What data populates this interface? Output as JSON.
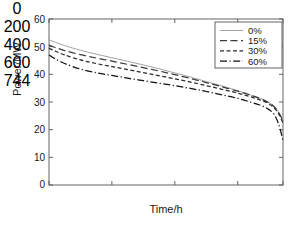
{
  "chart_data": {
    "type": "line",
    "title": "",
    "xlabel": "Time/h",
    "ylabel": "Power/MW",
    "xlim": [
      0,
      744
    ],
    "ylim": [
      0,
      60
    ],
    "xticks": [
      0,
      200,
      400,
      600,
      744
    ],
    "yticks": [
      0,
      10,
      20,
      30,
      40,
      50,
      60
    ],
    "grid": false,
    "legend_position": "upper right",
    "x": [
      0,
      20,
      50,
      100,
      150,
      200,
      250,
      300,
      350,
      400,
      450,
      500,
      550,
      600,
      640,
      670,
      695,
      715,
      730,
      744
    ],
    "series": [
      {
        "name": "0%",
        "label": "0%",
        "color": "#999999",
        "dash": "solid",
        "values": [
          52.5,
          51.6,
          50.4,
          48.7,
          47.3,
          46.0,
          44.7,
          43.4,
          42.0,
          40.5,
          39.0,
          37.4,
          35.8,
          34.1,
          32.6,
          31.4,
          30.1,
          28.5,
          26.3,
          23.3
        ]
      },
      {
        "name": "15%",
        "label": "15%",
        "color": "#3a3a3a",
        "dash": "long-dash",
        "values": [
          50.6,
          49.7,
          48.6,
          47.1,
          45.9,
          44.8,
          43.6,
          42.4,
          41.2,
          39.9,
          38.5,
          37.0,
          35.5,
          33.9,
          32.5,
          31.3,
          30.0,
          28.4,
          26.2,
          23.2
        ]
      },
      {
        "name": "30%",
        "label": "30%",
        "color": "#2a2a2a",
        "dash": "short-dash",
        "values": [
          49.4,
          48.4,
          47.0,
          45.2,
          43.9,
          42.8,
          41.7,
          40.6,
          39.5,
          38.4,
          37.2,
          35.9,
          34.6,
          33.2,
          31.9,
          30.8,
          29.6,
          28.0,
          25.8,
          22.4
        ]
      },
      {
        "name": "60%",
        "label": "60%",
        "color": "#111111",
        "dash": "dash-dot",
        "values": [
          47.0,
          45.6,
          43.9,
          41.9,
          40.6,
          39.6,
          38.6,
          37.7,
          36.8,
          35.9,
          34.9,
          33.8,
          32.6,
          31.3,
          30.0,
          28.9,
          27.6,
          25.6,
          22.0,
          16.2
        ]
      }
    ]
  },
  "axes": {
    "ylabel": "Power/MW",
    "xlabel": "Time/h",
    "ytick_labels": [
      "0",
      "10",
      "20",
      "30",
      "40",
      "50",
      "60"
    ],
    "xtick_labels": [
      "0",
      "200",
      "400",
      "600",
      "744"
    ]
  },
  "legend": {
    "entries": [
      {
        "label": "0%"
      },
      {
        "label": "15%"
      },
      {
        "label": "30%"
      },
      {
        "label": "60%"
      }
    ]
  }
}
